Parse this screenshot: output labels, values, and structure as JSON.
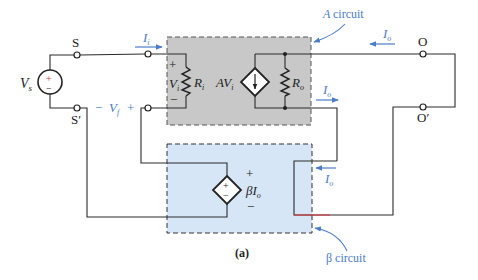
{
  "figure": {
    "caption": "(a)"
  },
  "colors": {
    "wire": "#2a2a2a",
    "a_box_fill": "#c8c8c8",
    "b_box_fill": "#d6e6f6",
    "annotation_blue": "#4a7cc8",
    "highlight_red": "#e0303a"
  },
  "source": {
    "label": "V",
    "subscript": "s",
    "plus": "+",
    "minus": "−"
  },
  "terminals": {
    "s": "S",
    "s_prime": "S′",
    "o": "O",
    "o_prime": "O′"
  },
  "a_circuit": {
    "title": "A circuit",
    "vi_plus": "+",
    "vi_label": "V",
    "vi_sub": "i",
    "vi_minus": "−",
    "ri_label": "R",
    "ri_sub": "i",
    "gain_label": "AV",
    "gain_sub": "i",
    "ro_label": "R",
    "ro_sub": "o"
  },
  "b_circuit": {
    "title": "β circuit",
    "source_plus": "+",
    "source_minus": "−",
    "out_plus": "+",
    "out_label": "βI",
    "out_sub": "o",
    "out_minus": "−"
  },
  "annotations": {
    "ii_label": "I",
    "ii_sub": "i",
    "io_top_label": "I",
    "io_top_sub": "o",
    "io_mid_label": "I",
    "io_mid_sub": "o",
    "io_low_label": "I",
    "io_low_sub": "o",
    "vf_minus": "−",
    "vf_label": "V",
    "vf_sub": "f",
    "vf_plus": "+"
  }
}
